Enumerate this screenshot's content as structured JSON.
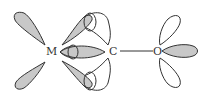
{
  "diagram": {
    "atoms": [
      {
        "label": "M",
        "x": 52,
        "y": 54
      },
      {
        "label": "C",
        "x": 112,
        "y": 54
      },
      {
        "label": "O",
        "x": 157,
        "y": 54
      }
    ],
    "bonds": [
      {
        "from": "C",
        "to": "O"
      }
    ],
    "colors": {
      "shaded_lobe": "#c8c8c8",
      "outline": "#333333",
      "background": "#ffffff"
    }
  }
}
